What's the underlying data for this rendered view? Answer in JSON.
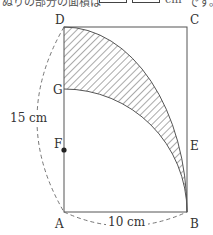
{
  "header": {
    "cut_text_left": "ぬりの部分の面積は",
    "unit": "cm",
    "cut_text_right": "です。",
    "answer_boxes": [
      "",
      ""
    ]
  },
  "figure": {
    "points": {
      "A": "A",
      "B": "B",
      "C": "C",
      "D": "D",
      "E": "E",
      "F": "F",
      "G": "G"
    },
    "dimensions": {
      "AD_length": "15 cm",
      "AB_length": "10 cm"
    },
    "colors": {
      "stroke": "#555555",
      "dash": "#666666",
      "hatch": "#555555"
    }
  }
}
